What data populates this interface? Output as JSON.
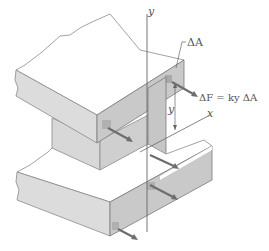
{
  "diagram": {
    "labels": {
      "y_axis_top": "y",
      "x_axis": "x",
      "delta_a": "ΔA",
      "force_equation": "ΔF = ky ΔA",
      "y_distance": "y"
    },
    "colors": {
      "face_gray": "#cfcfcf",
      "face_light": "#e4e4e4",
      "top_white": "#ffffff",
      "edge": "#7a7a7a",
      "arrow": "#6e6e6e",
      "patch": "#a9a9a9",
      "axis": "#666666"
    }
  }
}
